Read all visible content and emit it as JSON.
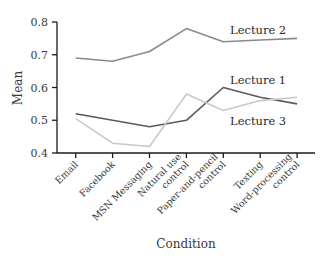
{
  "chart_data": {
    "type": "line",
    "title": "",
    "xlabel": "Condition",
    "ylabel": "Mean",
    "ylim": [
      0.4,
      0.8
    ],
    "yticks": [
      "0.4",
      "0.5",
      "0.6",
      "0.7",
      "0.8"
    ],
    "grid": false,
    "legend_position": "inline labels",
    "categories": [
      "Email",
      "Facebook",
      "MSN Messaging",
      "Natural use control",
      "Paper-and-pencil control",
      "Texting",
      "Word-processing control"
    ],
    "category_label_lines": [
      [
        "Email"
      ],
      [
        "Facebook"
      ],
      [
        "MSN Messaging"
      ],
      [
        "Natural use",
        "control"
      ],
      [
        "Paper-and-pencil",
        "control"
      ],
      [
        "Texting"
      ],
      [
        "Word-processing",
        "control"
      ]
    ],
    "series": [
      {
        "name": "Lecture 2",
        "color": "#8a8a8a",
        "values": [
          0.69,
          0.68,
          0.71,
          0.78,
          0.74,
          0.745,
          0.75
        ]
      },
      {
        "name": "Lecture 1",
        "color": "#5a5a5a",
        "values": [
          0.52,
          0.5,
          0.48,
          0.5,
          0.6,
          0.57,
          0.55
        ]
      },
      {
        "name": "Lecture 3",
        "color": "#c8c8c8",
        "values": [
          0.505,
          0.43,
          0.42,
          0.58,
          0.53,
          0.56,
          0.57
        ]
      }
    ],
    "annotations": [
      {
        "text": "Lecture 2",
        "near_category": "Paper-and-pencil control",
        "position": "above"
      },
      {
        "text": "Lecture 1",
        "near_category": "Paper-and-pencil control",
        "position": "above"
      },
      {
        "text": "Lecture 3",
        "near_category": "Paper-and-pencil control",
        "position": "below"
      }
    ]
  }
}
